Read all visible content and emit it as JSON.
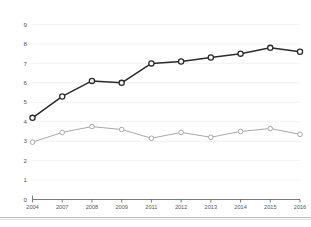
{
  "chart_data": {
    "type": "line",
    "title": "",
    "subtitle": "",
    "xlabel": "",
    "ylabel": "",
    "x": [
      "2004",
      "2007",
      "2008",
      "2009",
      "2011",
      "2012",
      "2013",
      "2014",
      "2015",
      "2016"
    ],
    "categories": [
      "2004",
      "2007",
      "2008",
      "2009",
      "2011",
      "2012",
      "2013",
      "2014",
      "2015",
      "2016"
    ],
    "series": [
      {
        "name": "dark-series",
        "color": "#2b2b2b",
        "marker": "open-circle",
        "values": [
          4.2,
          5.3,
          6.1,
          6.0,
          7.0,
          7.1,
          7.3,
          7.5,
          7.8,
          7.6
        ]
      },
      {
        "name": "light-series",
        "color": "#a9a9ad",
        "marker": "open-circle",
        "values": [
          2.95,
          3.45,
          3.75,
          3.6,
          3.15,
          3.45,
          3.2,
          3.5,
          3.65,
          3.35
        ]
      }
    ],
    "ylim": [
      0,
      9
    ],
    "yticks": [
      0,
      1,
      2,
      3,
      4,
      5,
      6,
      7,
      8,
      9
    ],
    "ytick_labels": [
      "0",
      "1",
      "2",
      "3",
      "4",
      "5",
      "6",
      "7",
      "8",
      "9"
    ],
    "xtick_labels": [
      "2004",
      "2007",
      "2008",
      "2009",
      "2011",
      "2012",
      "2013",
      "2014",
      "2015",
      "2016"
    ],
    "grid": true,
    "grid_axis": "y",
    "legend": false,
    "legend_position": "none",
    "annotations": []
  },
  "colors": {
    "background": "#ffffff",
    "gridline": "#ededf0",
    "axis": "#5a5a5a",
    "tick_label": "#555555",
    "series_dark": "#2b2b2b",
    "series_light": "#a9a9ad",
    "footer_rule": "#b9b9bd"
  }
}
